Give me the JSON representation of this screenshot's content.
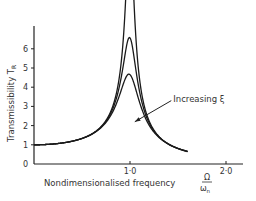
{
  "chart_data": {
    "type": "line",
    "title": "",
    "xlabel": "Nondimensionalised frequency",
    "xlabel_symbol": {
      "numerator": "Ω",
      "denominator": "ω",
      "denominator_sub": "n"
    },
    "ylabel": "Transmissibility T",
    "ylabel_sub": "R",
    "xlim": [
      0,
      2.2
    ],
    "ylim": [
      0,
      7.2
    ],
    "x_ticks": [
      {
        "value": 1.0,
        "label": "1·0"
      },
      {
        "value": 2.0,
        "label": "2·0"
      }
    ],
    "y_ticks": [
      {
        "value": 0,
        "label": "0"
      },
      {
        "value": 1,
        "label": "1"
      },
      {
        "value": 2,
        "label": "2"
      },
      {
        "value": 3,
        "label": "3"
      },
      {
        "value": 4,
        "label": "4"
      },
      {
        "value": 5,
        "label": "5"
      },
      {
        "value": 6,
        "label": "6"
      }
    ],
    "grid": false,
    "series": [
      {
        "name": "low damping",
        "zeta": 0.04,
        "peak": "off-scale (>7)"
      },
      {
        "name": "medium damping",
        "zeta": 0.077,
        "peak": 6.6
      },
      {
        "name": "high damping",
        "zeta": 0.11,
        "peak": 4.6
      }
    ],
    "x_range_plotted": [
      0,
      1.6
    ],
    "crossover_point": {
      "x": 1.414,
      "y": 1.0
    },
    "annotation": {
      "text": "Increasing ξ",
      "arrow_from": [
        1.43,
        3.3
      ],
      "arrow_to": [
        1.05,
        2.2
      ]
    }
  }
}
